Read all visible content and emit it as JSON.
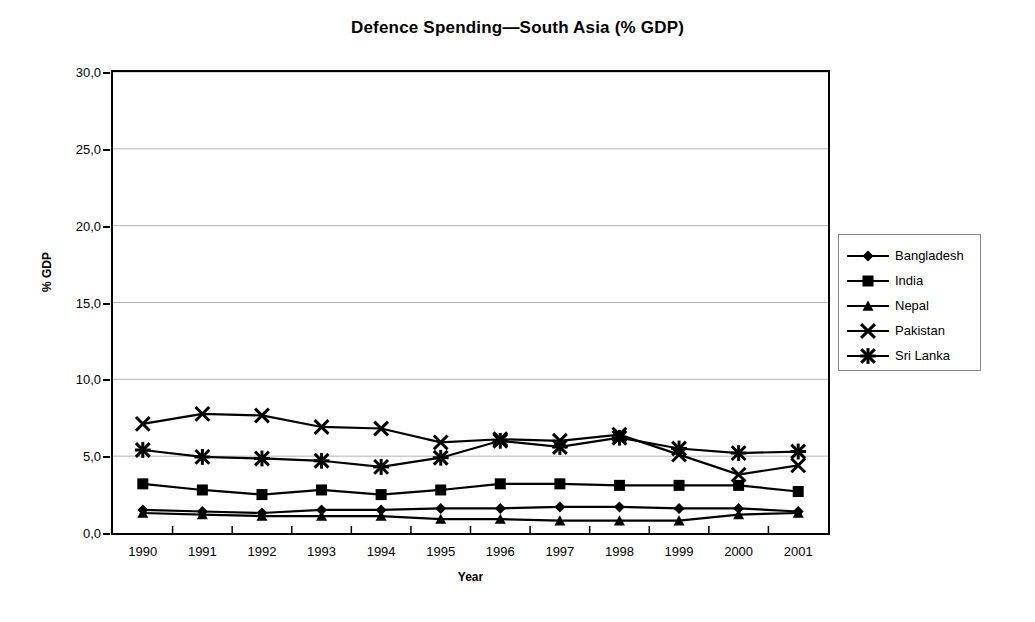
{
  "chart_data": {
    "type": "line",
    "title": "Defence Spending—South Asia (% GDP)",
    "xlabel": "Year",
    "ylabel": "% GDP",
    "categories": [
      "1990",
      "1991",
      "1992",
      "1993",
      "1994",
      "1995",
      "1996",
      "1997",
      "1998",
      "1999",
      "2000",
      "2001"
    ],
    "ylim": [
      0,
      30
    ],
    "ytick_labels": [
      "0,0",
      "5,0",
      "10,0",
      "15,0",
      "20,0",
      "25,0",
      "30,0"
    ],
    "ytick_values": [
      0,
      5,
      10,
      15,
      20,
      25,
      30
    ],
    "grid": "horizontal",
    "legend_position": "right",
    "series": [
      {
        "name": "Bangladesh",
        "marker": "diamond",
        "values": [
          1.5,
          1.4,
          1.3,
          1.5,
          1.5,
          1.6,
          1.6,
          1.7,
          1.7,
          1.6,
          1.6,
          1.4
        ]
      },
      {
        "name": "India",
        "marker": "square",
        "values": [
          3.2,
          2.8,
          2.5,
          2.8,
          2.5,
          2.8,
          3.2,
          3.2,
          3.1,
          3.1,
          3.1,
          2.7
        ]
      },
      {
        "name": "Nepal",
        "marker": "triangle",
        "values": [
          1.3,
          1.2,
          1.1,
          1.1,
          1.1,
          0.9,
          0.9,
          0.8,
          0.8,
          0.8,
          1.2,
          1.3
        ]
      },
      {
        "name": "Pakistan",
        "marker": "cross",
        "values": [
          7.1,
          7.75,
          7.65,
          6.9,
          6.8,
          5.9,
          6.1,
          6.0,
          6.4,
          5.1,
          3.8,
          4.4
        ]
      },
      {
        "name": "Sri Lanka",
        "marker": "asterisk",
        "values": [
          5.4,
          4.95,
          4.85,
          4.7,
          4.3,
          4.9,
          6.0,
          5.6,
          6.2,
          5.5,
          5.2,
          5.3
        ]
      }
    ]
  },
  "legend": {
    "entries": [
      {
        "label": "Bangladesh"
      },
      {
        "label": "India"
      },
      {
        "label": "Nepal"
      },
      {
        "label": "Pakistan"
      },
      {
        "label": "Sri Lanka"
      }
    ]
  },
  "colors": {
    "series": "#000000",
    "axis": "#000000",
    "grid": "#b4b4b4",
    "background": "#ffffff",
    "legend_border": "#888888"
  }
}
